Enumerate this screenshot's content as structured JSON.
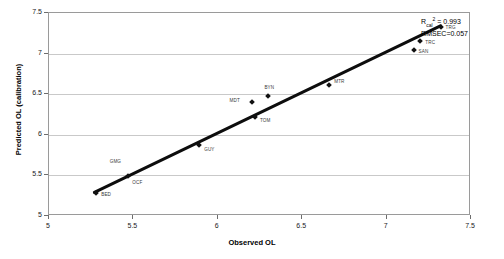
{
  "chart_data": {
    "type": "scatter",
    "title": "",
    "xlabel": "Observed OL",
    "ylabel": "Predicted OL (calibration)",
    "xlim": [
      5,
      7.5
    ],
    "ylim": [
      5,
      7.5
    ],
    "xticks": [
      "5",
      "5.5",
      "6",
      "6.5",
      "7",
      "7.5"
    ],
    "yticks": [
      "5",
      "5.5",
      "6",
      "6.5",
      "7",
      "7.5"
    ],
    "grid": "horizontal",
    "legend": "none",
    "annotations": {
      "r2_prefix": "R",
      "r2_sub": "cal",
      "r2_sup": "2",
      "r2_value": " = 0.993",
      "rmsec": "RMSEC=0.057"
    },
    "trendline": {
      "type": "linear",
      "x": [
        5.27,
        7.33
      ],
      "y": [
        5.27,
        7.34
      ]
    },
    "points": [
      {
        "label": "BED",
        "x": 5.28,
        "y": 5.28,
        "label_dx": 5,
        "label_dy": 2
      },
      {
        "label": "OCF",
        "x": 5.47,
        "y": 5.49,
        "label_dx": 4,
        "label_dy": 7
      },
      {
        "label": "GMG",
        "x": 5.36,
        "y": 5.67,
        "label_dx": 0,
        "label_dy": 0
      },
      {
        "label": "GUY",
        "x": 5.89,
        "y": 5.88,
        "label_dx": 5,
        "label_dy": 5
      },
      {
        "label": "MDT",
        "x": 6.2,
        "y": 6.4,
        "label_dx": -22,
        "label_dy": -1
      },
      {
        "label": "TOM",
        "x": 6.22,
        "y": 6.22,
        "label_dx": 5,
        "label_dy": 4
      },
      {
        "label": "BYN",
        "x": 6.3,
        "y": 6.48,
        "label_dx": -4,
        "label_dy": -8
      },
      {
        "label": "MTR",
        "x": 6.66,
        "y": 6.61,
        "label_dx": 5,
        "label_dy": -3
      },
      {
        "label": "SAN",
        "x": 7.16,
        "y": 7.04,
        "label_dx": 5,
        "label_dy": 2
      },
      {
        "label": "TRC",
        "x": 7.2,
        "y": 7.15,
        "label_dx": 5,
        "label_dy": 2
      },
      {
        "label": "TRG",
        "x": 7.32,
        "y": 7.33,
        "label_dx": 5,
        "label_dy": 1
      }
    ],
    "floating_labels": [
      {
        "label": "GMG",
        "x": 5.36,
        "y": 5.67
      }
    ]
  }
}
